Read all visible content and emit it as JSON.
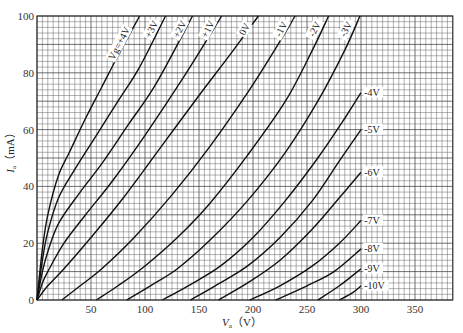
{
  "chart_data": {
    "type": "line",
    "title": "",
    "xlabel": "Va (V)",
    "xlabel_main": "V",
    "xlabel_sub": "a",
    "xlabel_unit": "（V）",
    "ylabel": "Ia (mA)",
    "ylabel_main": "I",
    "ylabel_sub": "a",
    "ylabel_unit": "（mA）",
    "xlim": [
      0,
      385
    ],
    "ylim": [
      0,
      100
    ],
    "x_ticks": [
      0,
      50,
      100,
      150,
      200,
      250,
      300,
      350
    ],
    "x_tick_labels": [
      "",
      "50",
      "100",
      "150",
      "200",
      "250",
      "300",
      "350"
    ],
    "y_ticks": [
      0,
      20,
      40,
      60,
      80,
      100
    ],
    "y_tick_labels": [
      "0",
      "20",
      "40",
      "60",
      "80",
      "100"
    ],
    "grid": true,
    "grid_minor_x": 5,
    "grid_minor_y": 2,
    "legend": "inline labels on curves",
    "parameter": "Vg",
    "series": [
      {
        "name": "Vg=+4V",
        "label": "Vg=+4V",
        "x": [
          0,
          5,
          10,
          20,
          30,
          45,
          60,
          75,
          95
        ],
        "y": [
          0,
          18,
          30,
          44,
          52,
          64,
          75,
          86,
          100
        ]
      },
      {
        "name": "+3V",
        "label": "+3V",
        "x": [
          0,
          5,
          10,
          20,
          35,
          55,
          75,
          95,
          119
        ],
        "y": [
          0,
          14,
          24,
          36,
          46,
          58,
          70,
          82,
          100
        ]
      },
      {
        "name": "+2V",
        "label": "+2V",
        "x": [
          0,
          5,
          10,
          20,
          40,
          60,
          85,
          110,
          144
        ],
        "y": [
          0,
          10,
          17,
          27,
          38,
          48,
          62,
          76,
          100
        ]
      },
      {
        "name": "+1V",
        "label": "+1V",
        "x": [
          0,
          5,
          10,
          25,
          45,
          70,
          100,
          135,
          171
        ],
        "y": [
          0,
          6,
          10,
          20,
          30,
          42,
          58,
          78,
          100
        ]
      },
      {
        "name": "0V",
        "label": "0V",
        "x": [
          0,
          10,
          25,
          50,
          80,
          115,
          150,
          180,
          205
        ],
        "y": [
          0,
          5,
          11,
          22,
          36,
          54,
          72,
          87,
          100
        ]
      },
      {
        "name": "-1V",
        "label": "-1V",
        "x": [
          23,
          40,
          60,
          90,
          125,
          160,
          195,
          220,
          239
        ],
        "y": [
          0,
          5,
          11,
          22,
          37,
          54,
          73,
          88,
          100
        ]
      },
      {
        "name": "-2V",
        "label": "-2V",
        "x": [
          55,
          75,
          100,
          130,
          160,
          195,
          230,
          255,
          270
        ],
        "y": [
          0,
          5,
          12,
          22,
          34,
          51,
          70,
          88,
          100
        ]
      },
      {
        "name": "-3V",
        "label": "-3V",
        "x": [
          83,
          105,
          130,
          160,
          195,
          230,
          260,
          285,
          299
        ],
        "y": [
          0,
          5,
          11,
          21,
          35,
          52,
          70,
          88,
          100
        ]
      },
      {
        "name": "-4V",
        "label": "-4V",
        "x": [
          116,
          140,
          170,
          200,
          230,
          260,
          285,
          300
        ],
        "y": [
          0,
          5,
          12,
          22,
          35,
          50,
          64,
          73
        ]
      },
      {
        "name": "-5V",
        "label": "-5V",
        "x": [
          142,
          165,
          195,
          225,
          255,
          280,
          300
        ],
        "y": [
          0,
          5,
          12,
          22,
          35,
          49,
          60
        ]
      },
      {
        "name": "-6V",
        "label": "-6V",
        "x": [
          168,
          195,
          225,
          255,
          280,
          300
        ],
        "y": [
          0,
          6,
          14,
          25,
          36,
          45
        ]
      },
      {
        "name": "-7V",
        "label": "-7V",
        "x": [
          197,
          225,
          255,
          280,
          300
        ],
        "y": [
          0,
          5,
          12,
          20,
          28
        ]
      },
      {
        "name": "-8V",
        "label": "-8V",
        "x": [
          221,
          250,
          275,
          300
        ],
        "y": [
          0,
          5,
          10,
          18
        ]
      },
      {
        "name": "-9V",
        "label": "-9V",
        "x": [
          260,
          280,
          300
        ],
        "y": [
          0,
          5,
          11
        ]
      },
      {
        "name": "-10V",
        "label": "-10V",
        "x": [
          280,
          292,
          300
        ],
        "y": [
          0,
          2.5,
          5
        ]
      }
    ],
    "right_labels": [
      {
        "text": "-4V",
        "x": 303,
        "y": 73
      },
      {
        "text": "-5V",
        "x": 303,
        "y": 60
      },
      {
        "text": "-6V",
        "x": 303,
        "y": 45
      },
      {
        "text": "-7V",
        "x": 303,
        "y": 28
      },
      {
        "text": "-8V",
        "x": 303,
        "y": 18
      },
      {
        "text": "-9V",
        "x": 303,
        "y": 11
      },
      {
        "text": "-10V",
        "x": 303,
        "y": 5
      }
    ],
    "top_labels": [
      {
        "text": "Vg=+4V",
        "x": 78,
        "y": 90
      },
      {
        "text": "+3V",
        "x": 108,
        "y": 95
      },
      {
        "text": "+2V",
        "x": 134,
        "y": 95
      },
      {
        "text": "+1V",
        "x": 160,
        "y": 95
      },
      {
        "text": "0V",
        "x": 194,
        "y": 95
      },
      {
        "text": "-1V",
        "x": 228,
        "y": 95
      },
      {
        "text": "-2V",
        "x": 259,
        "y": 95
      },
      {
        "text": "-3V",
        "x": 288,
        "y": 95
      }
    ]
  }
}
